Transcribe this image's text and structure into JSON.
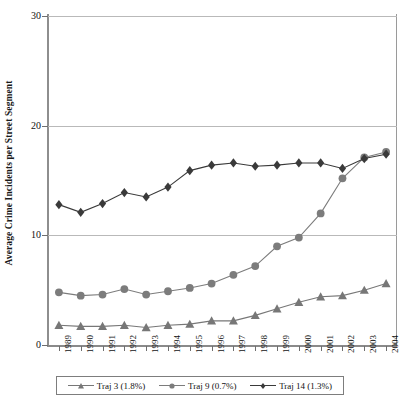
{
  "chart_data": {
    "type": "line",
    "title": "",
    "xlabel": "",
    "ylabel": "Average Crime Incidents per Street Segment",
    "ylim": [
      0,
      30
    ],
    "yticks": [
      0,
      10,
      20,
      30
    ],
    "grid": true,
    "legend_position": "bottom",
    "categories": [
      "1989",
      "1990",
      "1991",
      "1992",
      "1993",
      "1994",
      "1995",
      "1996",
      "1997",
      "1998",
      "1999",
      "2000",
      "2001",
      "2002",
      "2003",
      "2004"
    ],
    "series": [
      {
        "name": "Traj 3 (1.8%)",
        "marker": "triangle",
        "color": "#777777",
        "values": [
          1.8,
          1.7,
          1.7,
          1.8,
          1.6,
          1.8,
          1.9,
          2.2,
          2.2,
          2.7,
          3.3,
          3.9,
          4.4,
          4.5,
          5.0,
          5.6
        ]
      },
      {
        "name": "Traj 9 (0.7%)",
        "marker": "circle",
        "color": "#7c7c7c",
        "values": [
          4.8,
          4.5,
          4.6,
          5.1,
          4.6,
          4.9,
          5.2,
          5.6,
          6.4,
          7.2,
          9.0,
          9.8,
          12.0,
          15.2,
          17.1,
          17.6
        ]
      },
      {
        "name": "Traj 14 (1.3%)",
        "marker": "diamond",
        "color": "#3a3a3a",
        "values": [
          12.8,
          12.1,
          12.9,
          13.9,
          13.5,
          14.4,
          15.9,
          16.4,
          16.6,
          16.3,
          16.4,
          16.6,
          16.6,
          16.1,
          17.0,
          17.4
        ]
      }
    ]
  },
  "axis": {
    "y_tick_labels": [
      "30",
      "20",
      "10",
      "0"
    ],
    "y_title": "Average Crime Incidents per Street Segment"
  },
  "legend": {
    "entries": [
      {
        "label": "Traj 3 (1.8%)"
      },
      {
        "label": "Traj 9 (0.7%)"
      },
      {
        "label": "Traj 14 (1.3%)"
      }
    ]
  }
}
